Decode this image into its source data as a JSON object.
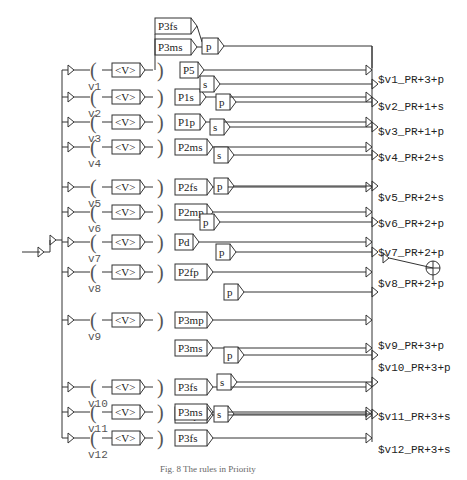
{
  "diagram": {
    "input_token": "<V>",
    "variables": [
      "v1",
      "v2",
      "v3",
      "v4",
      "v5",
      "v6",
      "v7",
      "v8",
      "v9",
      "v10",
      "v11",
      "v12"
    ],
    "top_inputs": [
      "P3fs",
      "P3ms",
      "P5"
    ],
    "row_rules": [
      {
        "var": "v1",
        "rules": [
          "P5"
        ]
      },
      {
        "var": "v2",
        "rules": [
          "P1s"
        ]
      },
      {
        "var": "v3",
        "rules": [
          "P1p"
        ]
      },
      {
        "var": "v4",
        "rules": [
          "P2ms"
        ]
      },
      {
        "var": "v5",
        "rules": [
          "P2fs"
        ]
      },
      {
        "var": "v6",
        "rules": [
          "P2mp"
        ]
      },
      {
        "var": "v7",
        "rules": [
          "Pd"
        ]
      },
      {
        "var": "v8",
        "rules": [
          "P2fp"
        ]
      },
      {
        "var": "v9",
        "rules": [
          "P3mp",
          "P3ms"
        ]
      },
      {
        "var": "v10",
        "rules": [
          "P3fs",
          "P3fp"
        ]
      },
      {
        "var": "v11",
        "rules": [
          "P3ms"
        ]
      },
      {
        "var": "v12",
        "rules": [
          "P3fs"
        ]
      }
    ],
    "gates": [
      "p",
      "s",
      "p",
      "s",
      "s",
      "p",
      "p",
      "p",
      "p",
      "p",
      "s",
      "s"
    ],
    "outputs": [
      "$v1_PR+3+p",
      "$v2_PR+1+s",
      "$v3_PR+1+p",
      "$v4_PR+2+s",
      "$v5_PR+2+s",
      "$v6_PR+2+p",
      "$v7_PR+2+p",
      "$v8_PR+2+p",
      "$v9_PR+3+p",
      "$v10_PR+3+p",
      "$v11_PR+3+s",
      "$v12_PR+3+s"
    ],
    "caption": "Fig. 8  The rules in Priority"
  }
}
